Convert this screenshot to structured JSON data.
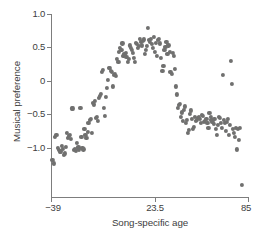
{
  "chart_data": {
    "type": "scatter",
    "title": "",
    "xlabel": "Song-specific age",
    "ylabel": "Musical preference",
    "xlim": [
      -39,
      85
    ],
    "ylim": [
      -1.62,
      1.0
    ],
    "grid": false,
    "legend": null,
    "marker_color": "#70706f",
    "axis_color": "#7d7d7d",
    "xticks": [
      -39,
      23.5,
      85
    ],
    "xticklabels": [
      "−39",
      "23.5",
      "85"
    ],
    "yticks": [
      1.0,
      0.5,
      0,
      -0.5,
      -1.0
    ],
    "yticklabels": [
      "1.0",
      "0.5",
      "0",
      "−0.5",
      "−1.0"
    ],
    "points": [
      [
        -38.1,
        -1.18
      ],
      [
        -37.0,
        -1.23
      ],
      [
        -36.4,
        -0.83
      ],
      [
        -35.6,
        -0.8
      ],
      [
        -34.9,
        -1.0
      ],
      [
        -34.2,
        -1.03
      ],
      [
        -33.6,
        -1.06
      ],
      [
        -33.0,
        -1.05
      ],
      [
        -32.3,
        -0.97
      ],
      [
        -31.7,
        -1.01
      ],
      [
        -31.0,
        -1.1
      ],
      [
        -30.4,
        -1.08
      ],
      [
        -29.8,
        -0.98
      ],
      [
        -29.1,
        -0.78
      ],
      [
        -28.5,
        -0.85
      ],
      [
        -27.8,
        -0.82
      ],
      [
        -27.2,
        -0.8
      ],
      [
        -26.5,
        -0.87
      ],
      [
        -25.9,
        -0.41
      ],
      [
        -25.0,
        -0.41
      ],
      [
        -24.4,
        -1.03
      ],
      [
        -23.8,
        -1.01
      ],
      [
        -23.1,
        -1.04
      ],
      [
        -22.5,
        -0.92
      ],
      [
        -21.8,
        -0.99
      ],
      [
        -21.2,
        -1.02
      ],
      [
        -20.5,
        -0.4
      ],
      [
        -19.9,
        -0.83
      ],
      [
        -19.2,
        -1.0
      ],
      [
        -18.6,
        -1.02
      ],
      [
        -18.0,
        -0.72
      ],
      [
        -17.3,
        -0.8
      ],
      [
        -16.7,
        -0.85
      ],
      [
        -16.0,
        -0.76
      ],
      [
        -15.4,
        -0.62
      ],
      [
        -14.7,
        -0.58
      ],
      [
        -14.1,
        -0.56
      ],
      [
        -13.4,
        -0.78
      ],
      [
        -12.8,
        -0.33
      ],
      [
        -12.1,
        -0.35
      ],
      [
        -11.5,
        -0.3
      ],
      [
        -10.8,
        -0.55
      ],
      [
        -10.2,
        -0.53
      ],
      [
        -9.6,
        -0.6
      ],
      [
        -8.9,
        -0.25
      ],
      [
        -8.3,
        -0.22
      ],
      [
        -7.6,
        -0.19
      ],
      [
        -7.0,
        0.14
      ],
      [
        -6.3,
        0.16
      ],
      [
        -5.7,
        -0.4
      ],
      [
        -5.0,
        -0.52
      ],
      [
        -4.4,
        -0.24
      ],
      [
        -3.7,
        -0.1
      ],
      [
        -3.1,
        0.02
      ],
      [
        -2.5,
        0.19
      ],
      [
        -1.8,
        0.19
      ],
      [
        -1.2,
        0.15
      ],
      [
        -0.5,
        0.13
      ],
      [
        0.1,
        -0.08
      ],
      [
        0.8,
        0.09
      ],
      [
        1.4,
        0.11
      ],
      [
        2.1,
        0.08
      ],
      [
        2.7,
        0.33
      ],
      [
        3.4,
        0.28
      ],
      [
        4.0,
        0.44
      ],
      [
        4.6,
        0.5
      ],
      [
        5.3,
        0.47
      ],
      [
        5.9,
        0.56
      ],
      [
        6.6,
        0.38
      ],
      [
        7.2,
        0.4
      ],
      [
        7.9,
        0.42
      ],
      [
        8.5,
        0.36
      ],
      [
        9.2,
        0.28
      ],
      [
        9.8,
        0.33
      ],
      [
        10.5,
        0.53
      ],
      [
        11.1,
        0.5
      ],
      [
        11.7,
        0.47
      ],
      [
        12.4,
        0.42
      ],
      [
        13.0,
        0.34
      ],
      [
        13.7,
        0.29
      ],
      [
        14.3,
        0.57
      ],
      [
        15.0,
        0.55
      ],
      [
        15.6,
        0.49
      ],
      [
        16.3,
        0.52
      ],
      [
        16.9,
        0.63
      ],
      [
        17.5,
        0.58
      ],
      [
        18.2,
        0.53
      ],
      [
        18.8,
        0.6
      ],
      [
        19.5,
        0.62
      ],
      [
        20.1,
        0.41
      ],
      [
        20.8,
        0.47
      ],
      [
        21.4,
        0.52
      ],
      [
        22.1,
        0.79
      ],
      [
        22.7,
        0.61
      ],
      [
        23.3,
        0.58
      ],
      [
        24.0,
        0.63
      ],
      [
        24.6,
        0.55
      ],
      [
        25.3,
        0.5
      ],
      [
        25.9,
        0.66
      ],
      [
        26.6,
        0.44
      ],
      [
        27.2,
        0.57
      ],
      [
        27.9,
        0.37
      ],
      [
        28.5,
        0.61
      ],
      [
        29.1,
        0.63
      ],
      [
        29.8,
        0.56
      ],
      [
        30.4,
        0.35
      ],
      [
        31.1,
        0.15
      ],
      [
        31.7,
        0.22
      ],
      [
        32.4,
        0.47
      ],
      [
        33.0,
        0.51
      ],
      [
        33.6,
        0.58
      ],
      [
        34.3,
        0.4
      ],
      [
        34.9,
        0.53
      ],
      [
        35.6,
        0.44
      ],
      [
        36.2,
        0.13
      ],
      [
        36.9,
        0.1
      ],
      [
        37.5,
        0.42
      ],
      [
        38.2,
        0.37
      ],
      [
        38.8,
        0.18
      ],
      [
        39.4,
        -0.08
      ],
      [
        40.1,
        -0.2
      ],
      [
        40.7,
        -0.4
      ],
      [
        41.4,
        -0.36
      ],
      [
        42.0,
        -0.34
      ],
      [
        42.7,
        -0.54
      ],
      [
        43.3,
        -0.47
      ],
      [
        44.0,
        -0.6
      ],
      [
        44.6,
        -0.43
      ],
      [
        45.2,
        -0.38
      ],
      [
        45.9,
        -0.62
      ],
      [
        46.5,
        -0.58
      ],
      [
        47.2,
        -0.78
      ],
      [
        47.8,
        -0.73
      ],
      [
        48.5,
        -0.49
      ],
      [
        49.1,
        -0.44
      ],
      [
        49.8,
        -0.56
      ],
      [
        50.4,
        -0.71
      ],
      [
        51.0,
        -0.68
      ],
      [
        51.7,
        -0.53
      ],
      [
        52.3,
        -0.6
      ],
      [
        53.0,
        -0.58
      ],
      [
        53.6,
        -0.55
      ],
      [
        54.3,
        -0.54
      ],
      [
        54.9,
        -0.57
      ],
      [
        55.6,
        -0.62
      ],
      [
        56.2,
        -0.5
      ],
      [
        56.8,
        -0.52
      ],
      [
        57.5,
        -0.61
      ],
      [
        58.1,
        -0.59
      ],
      [
        58.8,
        -0.56
      ],
      [
        59.4,
        -0.63
      ],
      [
        60.1,
        -0.7
      ],
      [
        60.7,
        -0.48
      ],
      [
        61.4,
        -0.53
      ],
      [
        62.0,
        -0.58
      ],
      [
        62.6,
        -0.61
      ],
      [
        63.3,
        -0.64
      ],
      [
        63.9,
        -0.57
      ],
      [
        64.6,
        -0.72
      ],
      [
        65.2,
        -0.8
      ],
      [
        65.9,
        -0.66
      ],
      [
        66.5,
        -0.54
      ],
      [
        67.2,
        -0.55
      ],
      [
        67.8,
        -0.63
      ],
      [
        68.4,
        -0.7
      ],
      [
        69.1,
        0.09
      ],
      [
        69.7,
        -0.58
      ],
      [
        70.4,
        -0.63
      ],
      [
        71.0,
        -0.74
      ],
      [
        71.7,
        -0.61
      ],
      [
        72.3,
        -0.57
      ],
      [
        73.0,
        -0.8
      ],
      [
        73.6,
        -0.66
      ],
      [
        74.2,
        0.3
      ],
      [
        74.9,
        -0.04
      ],
      [
        75.5,
        -0.72
      ],
      [
        76.2,
        -0.78
      ],
      [
        76.8,
        -0.84
      ],
      [
        77.5,
        -0.7
      ],
      [
        78.1,
        -1.02
      ],
      [
        78.8,
        -0.71
      ],
      [
        79.4,
        -0.88
      ],
      [
        80.0,
        -0.7
      ],
      [
        81.3,
        -1.55
      ]
    ]
  }
}
